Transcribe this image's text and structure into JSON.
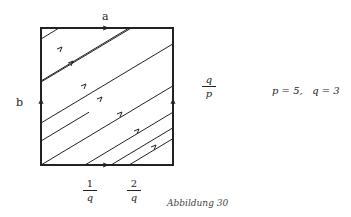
{
  "diagram": {
    "type": "torus-line-flow",
    "labels": {
      "top": "a",
      "left": "b",
      "right_fraction": {
        "numerator": "q",
        "denominator": "p"
      },
      "params": "p = 5,   q = 3",
      "bottom_fractions": [
        {
          "numerator": "1",
          "denominator": "q"
        },
        {
          "numerator": "2",
          "denominator": "q"
        }
      ],
      "caption": "Abbildung 30"
    },
    "params": {
      "p": 5,
      "q": 3
    },
    "colors": {
      "stroke": "#222222",
      "background": "#ffffff"
    }
  }
}
